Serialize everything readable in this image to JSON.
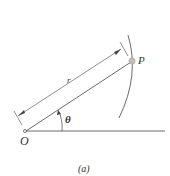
{
  "diagram": {
    "labels": {
      "origin": "O",
      "point": "P",
      "radius": "r",
      "angle": "θ",
      "caption": "(a)"
    },
    "colors": {
      "line": "#444444",
      "point_fill": "#bdbdbd"
    }
  }
}
